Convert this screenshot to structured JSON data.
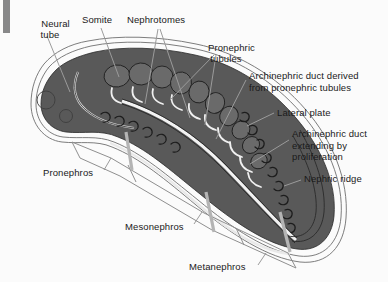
{
  "figure": {
    "title_absent": true,
    "background_color": "#fbfbfb",
    "embryo_fill_color": "#595959",
    "outline_color": "#4d4d4d",
    "text_color": "#1a1a1a",
    "leader_line_color": "#9a9a9a",
    "scan_bar_color": "#888889"
  },
  "labels": {
    "neural_tube": "Neural\ntube",
    "somite": "Somite",
    "nephrotomes": "Nephrotomes",
    "pronephric_tubules": "Pronephric\ntubules",
    "archinephric_duct_derived": "Archinephric duct derived\nfrom pronephric tubules",
    "lateral_plate": "Lateral plate",
    "archinephric_duct_extending": "Archinephric duct\nextending by\nproliferation",
    "nephric_ridge": "Nephric ridge",
    "pronephros": "Pronephros",
    "mesonephros": "Mesonephros",
    "metanephros": "Metanephros"
  },
  "label_list": [
    {
      "key": "neural_tube",
      "text": "Neural tube",
      "x": 28,
      "y": 10
    },
    {
      "key": "somite",
      "text": "Somite",
      "x": 83,
      "y": 18
    },
    {
      "key": "nephrotomes",
      "text": "Nephrotomes",
      "x": 128,
      "y": 18
    },
    {
      "key": "pronephric_tubules",
      "text": "Pronephric tubules",
      "x": 198,
      "y": 33
    },
    {
      "key": "archinephric_duct_derived",
      "text": "Archinephric duct derived from pronephric tubules",
      "x": 249,
      "y": 75
    },
    {
      "key": "lateral_plate",
      "text": "Lateral plate",
      "x": 277,
      "y": 111
    },
    {
      "key": "archinephric_duct_extending",
      "text": "Archinephric duct extending by proliferation",
      "x": 292,
      "y": 132
    },
    {
      "key": "nephric_ridge",
      "text": "Nephric ridge",
      "x": 304,
      "y": 177
    },
    {
      "key": "pronephros",
      "text": "Pronephros",
      "x": 44,
      "y": 171
    },
    {
      "key": "mesonephros",
      "text": "Mesonephros",
      "x": 126,
      "y": 225
    },
    {
      "key": "metanephros",
      "text": "Metanephros",
      "x": 190,
      "y": 265
    }
  ]
}
